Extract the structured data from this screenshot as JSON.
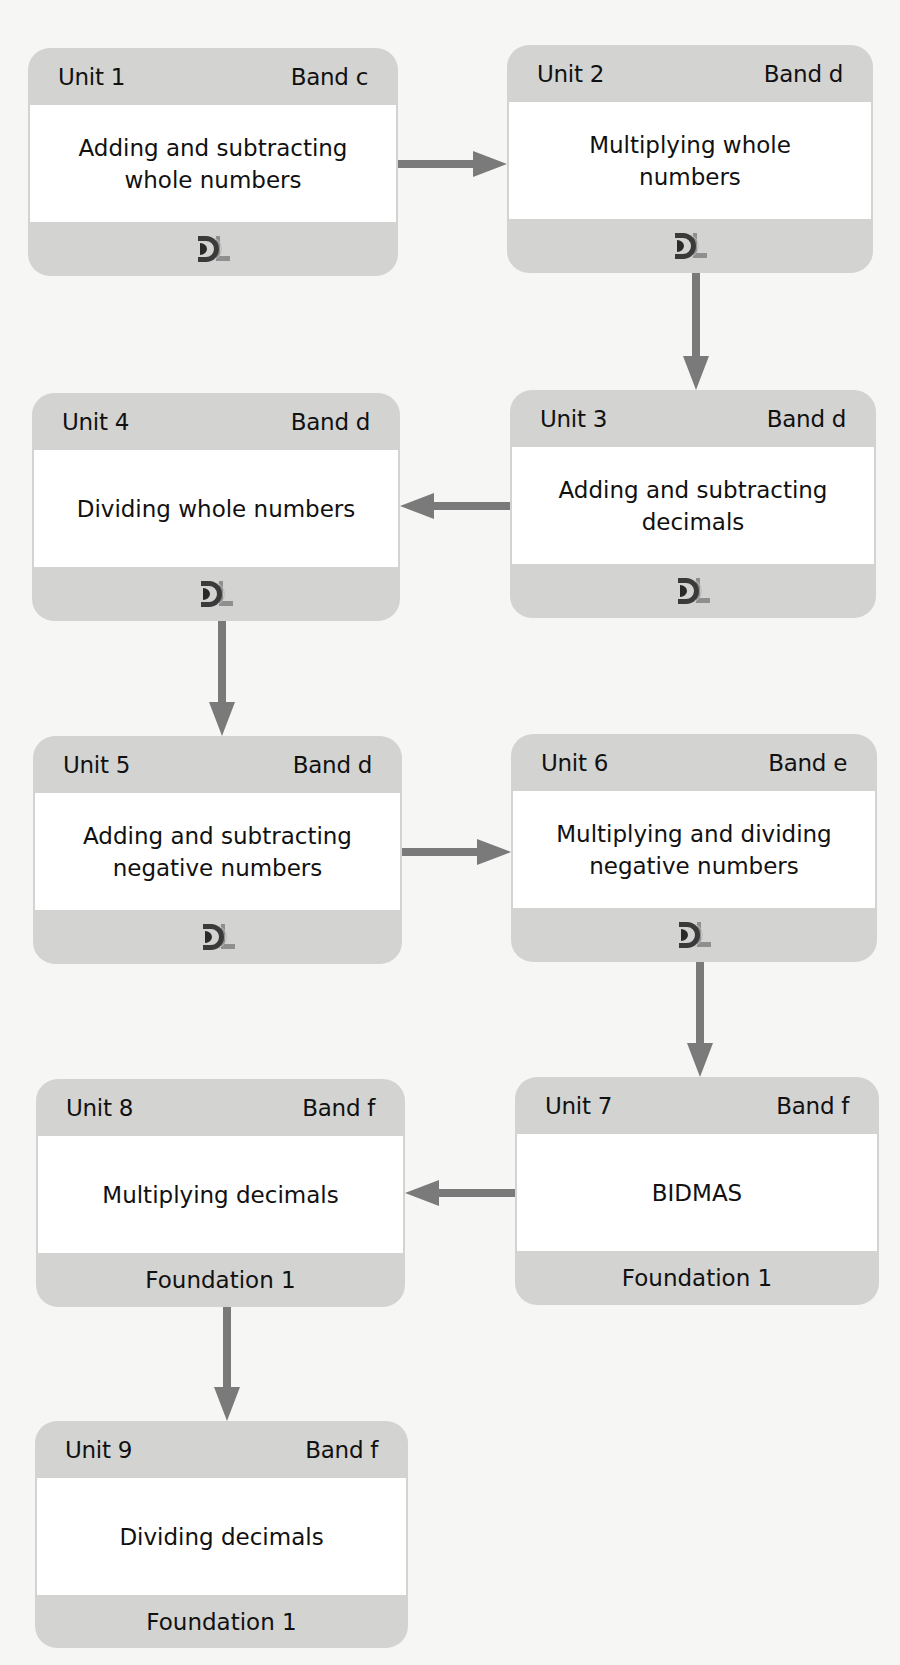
{
  "colors": {
    "background": "#f6f6f5",
    "card": "#d3d3d2",
    "card_body": "#ffffff",
    "arrow": "#7a7a7a",
    "text": "#111111"
  },
  "units": [
    {
      "unit": "Unit 1",
      "band": "Band c",
      "title": "Adding and subtracting\nwhole numbers",
      "footer_type": "logo",
      "footer_icon": "dl-logo-icon"
    },
    {
      "unit": "Unit 2",
      "band": "Band d",
      "title": "Multiplying whole\nnumbers",
      "footer_type": "logo",
      "footer_icon": "dl-logo-icon"
    },
    {
      "unit": "Unit 3",
      "band": "Band d",
      "title": "Adding and subtracting\ndecimals",
      "footer_type": "logo",
      "footer_icon": "dl-logo-icon"
    },
    {
      "unit": "Unit 4",
      "band": "Band d",
      "title": "Dividing whole numbers",
      "footer_type": "logo",
      "footer_icon": "dl-logo-icon"
    },
    {
      "unit": "Unit 5",
      "band": "Band d",
      "title": "Adding and subtracting\nnegative numbers",
      "footer_type": "logo",
      "footer_icon": "dl-logo-icon"
    },
    {
      "unit": "Unit 6",
      "band": "Band e",
      "title": "Multiplying and dividing\nnegative numbers",
      "footer_type": "logo",
      "footer_icon": "dl-logo-icon"
    },
    {
      "unit": "Unit 7",
      "band": "Band f",
      "title": "BIDMAS",
      "footer_type": "text",
      "footer": "Foundation 1"
    },
    {
      "unit": "Unit 8",
      "band": "Band f",
      "title": "Multiplying decimals",
      "footer_type": "text",
      "footer": "Foundation 1"
    },
    {
      "unit": "Unit 9",
      "band": "Band f",
      "title": "Dividing decimals",
      "footer_type": "text",
      "footer": "Foundation 1"
    }
  ],
  "connections": [
    {
      "from": "Unit 1",
      "to": "Unit 2",
      "direction": "right"
    },
    {
      "from": "Unit 2",
      "to": "Unit 3",
      "direction": "down"
    },
    {
      "from": "Unit 3",
      "to": "Unit 4",
      "direction": "left"
    },
    {
      "from": "Unit 4",
      "to": "Unit 5",
      "direction": "down"
    },
    {
      "from": "Unit 5",
      "to": "Unit 6",
      "direction": "right"
    },
    {
      "from": "Unit 6",
      "to": "Unit 7",
      "direction": "down"
    },
    {
      "from": "Unit 7",
      "to": "Unit 8",
      "direction": "left"
    },
    {
      "from": "Unit 8",
      "to": "Unit 9",
      "direction": "down"
    }
  ]
}
